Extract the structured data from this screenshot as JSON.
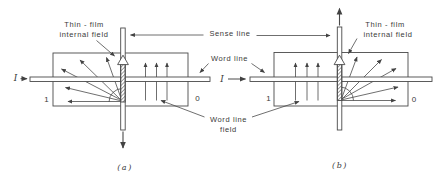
{
  "figure": {
    "colors": {
      "ink": "#424242",
      "text": "#3a3a3a",
      "background": "#ffffff"
    },
    "labels": {
      "thin_film_1": "Thin - film",
      "thin_film_2": "internal field",
      "sense_line": "Sense line",
      "word_line": "Word line",
      "word_line_field_1": "Word line",
      "word_line_field_2": "field",
      "current": "I",
      "one": "1",
      "zero": "0",
      "caption_a": "(a)",
      "caption_b": "(b)"
    }
  }
}
